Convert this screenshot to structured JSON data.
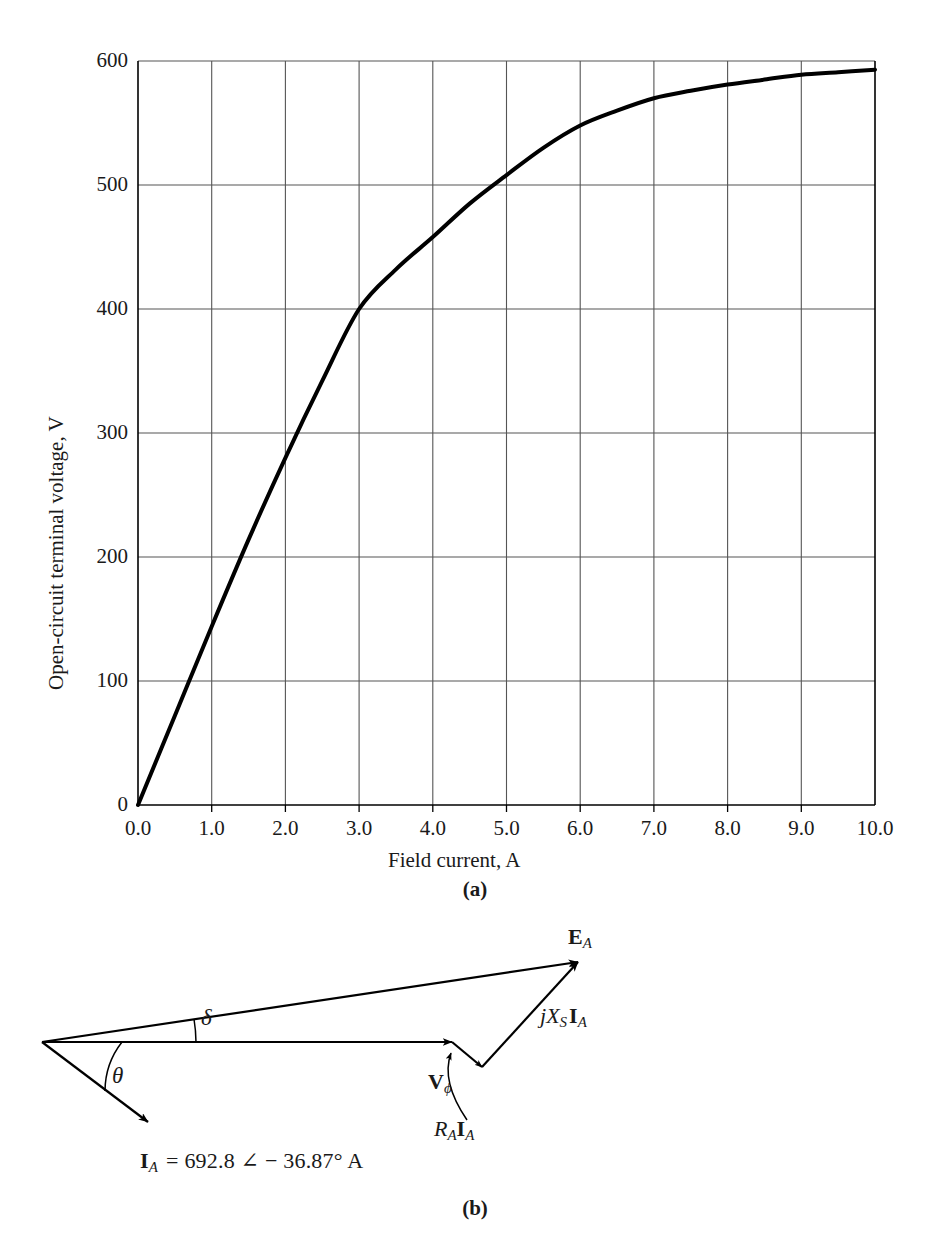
{
  "figure": {
    "panel_a_caption": "(a)",
    "panel_b_caption": "(b)"
  },
  "chart_data": {
    "type": "line",
    "title": "",
    "xlabel": "Field current, A",
    "ylabel": "Open-circuit terminal voltage, V",
    "xlim": [
      0.0,
      10.0
    ],
    "ylim": [
      0,
      600
    ],
    "grid": true,
    "legend": "none",
    "xticks": [
      "0.0",
      "1.0",
      "2.0",
      "3.0",
      "4.0",
      "5.0",
      "6.0",
      "7.0",
      "8.0",
      "9.0",
      "10.0"
    ],
    "yticks": [
      "0",
      "100",
      "200",
      "300",
      "400",
      "500",
      "600"
    ],
    "series": [
      {
        "name": "Open-circuit characteristic",
        "x": [
          0.0,
          0.5,
          1.0,
          1.5,
          2.0,
          2.5,
          3.0,
          3.5,
          4.0,
          4.5,
          5.0,
          5.5,
          6.0,
          6.5,
          7.0,
          7.5,
          8.0,
          8.5,
          9.0,
          9.5,
          10.0
        ],
        "y": [
          0,
          72,
          144,
          214,
          280,
          342,
          400,
          432,
          458,
          485,
          508,
          530,
          548,
          560,
          570,
          576,
          581,
          585,
          589,
          591,
          593
        ]
      }
    ]
  },
  "phasor": {
    "label_ea": "E",
    "label_ea_sub": "A",
    "label_jxsia_j": "j",
    "label_jxsia_x": "X",
    "label_jxsia_x_sub": "S",
    "label_jxsia_i": "I",
    "label_jxsia_i_sub": "A",
    "label_vphi": "V",
    "label_vphi_sub": "ϕ",
    "label_raia_r": "R",
    "label_raia_r_sub": "A",
    "label_raia_i": "I",
    "label_raia_i_sub": "A",
    "label_delta": "δ",
    "label_theta": "θ",
    "equation_i": "I",
    "equation_i_sub": "A",
    "equation_rest": "= 692.8 ∠ − 36.87° A"
  },
  "colors": {
    "curve": "#000000",
    "grid": "#555555",
    "axis": "#000000",
    "text": "#1a1a1a",
    "background": "#ffffff"
  }
}
